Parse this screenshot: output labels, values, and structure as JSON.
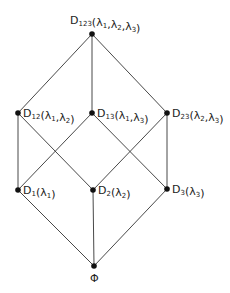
{
  "diagram": {
    "type": "lattice",
    "nodes": [
      {
        "id": "D123",
        "base": "D",
        "sub": "123",
        "args": [
          [
            "λ",
            "1"
          ],
          [
            "λ",
            "2"
          ],
          [
            "λ",
            "3"
          ]
        ]
      },
      {
        "id": "D12",
        "base": "D",
        "sub": "12",
        "args": [
          [
            "λ",
            "1"
          ],
          [
            "λ",
            "2"
          ]
        ]
      },
      {
        "id": "D13",
        "base": "D",
        "sub": "13",
        "args": [
          [
            "λ",
            "1"
          ],
          [
            "λ",
            "3"
          ]
        ]
      },
      {
        "id": "D23",
        "base": "D",
        "sub": "23",
        "args": [
          [
            "λ",
            "2"
          ],
          [
            "λ",
            "3"
          ]
        ]
      },
      {
        "id": "D1",
        "base": "D",
        "sub": "1",
        "args": [
          [
            "λ",
            "1"
          ]
        ]
      },
      {
        "id": "D2",
        "base": "D",
        "sub": "2",
        "args": [
          [
            "λ",
            "2"
          ]
        ]
      },
      {
        "id": "D3",
        "base": "D",
        "sub": "3",
        "args": [
          [
            "λ",
            "3"
          ]
        ]
      },
      {
        "id": "PHI",
        "base": "Φ",
        "sub": "",
        "args": []
      }
    ],
    "edges": [
      [
        "D123",
        "D12"
      ],
      [
        "D123",
        "D13"
      ],
      [
        "D123",
        "D23"
      ],
      [
        "D12",
        "D1"
      ],
      [
        "D12",
        "D2"
      ],
      [
        "D13",
        "D1"
      ],
      [
        "D13",
        "D3"
      ],
      [
        "D23",
        "D2"
      ],
      [
        "D23",
        "D3"
      ],
      [
        "D1",
        "PHI"
      ],
      [
        "D2",
        "PHI"
      ],
      [
        "D3",
        "PHI"
      ]
    ]
  }
}
